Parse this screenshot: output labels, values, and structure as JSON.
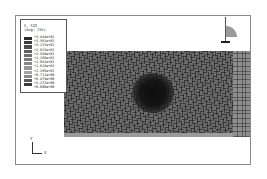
{
  "viewport": {
    "legend": {
      "title_line1": "S, S23",
      "title_line2": "(Avg: 75%)",
      "values": [
        "+3.884e+01",
        "+3.561e+01",
        "+3.237e+01",
        "+2.913e+01",
        "+2.589e+01",
        "+2.266e+01",
        "+1.942e+01",
        "+1.618e+01",
        "+1.295e+01",
        "+9.711e+00",
        "+6.474e+00",
        "+3.237e+00",
        "+0.000e+00"
      ],
      "colors": [
        "#2a2a2a",
        "#3c3c3c",
        "#4e4e4e",
        "#5e5e5e",
        "#6d6d6d",
        "#7b7b7b",
        "#888888",
        "#969696",
        "#a3a3a3",
        "#8a8a8a",
        "#5a5a5a",
        "#3a3a3a",
        "#1a1a1a"
      ]
    },
    "triad": {
      "x_label": "X",
      "y_label": "Y"
    },
    "model": {
      "description": "meshed plate contour plot with dark stress concentration at center"
    }
  }
}
